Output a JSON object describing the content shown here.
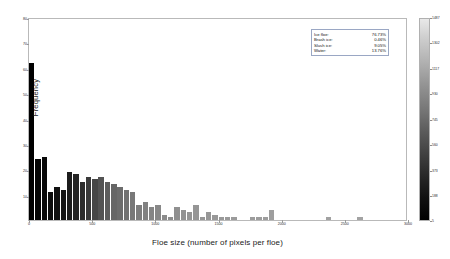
{
  "chart_data": {
    "type": "bar",
    "title": "",
    "xlabel": "Floe size (number of pixels per floe)",
    "ylabel": "Frequency",
    "xlim": [
      0,
      3000
    ],
    "ylim": [
      0,
      80
    ],
    "grid": false,
    "xticks": [
      0,
      500,
      1000,
      1500,
      2000,
      2500,
      3000
    ],
    "xticklabels": [
      "0",
      "500",
      "1000",
      "1500",
      "2000",
      "2500",
      "3000"
    ],
    "yticks": [
      10,
      20,
      30,
      40,
      50,
      60,
      70,
      80
    ],
    "yticklabels": [
      "10",
      "20",
      "30",
      "40",
      "50",
      "60",
      "70",
      "80"
    ],
    "bin_width": 50,
    "bin_centers": [
      25,
      75,
      125,
      175,
      225,
      275,
      325,
      375,
      425,
      475,
      525,
      575,
      625,
      675,
      725,
      775,
      825,
      875,
      925,
      975,
      1025,
      1075,
      1125,
      1175,
      1225,
      1275,
      1325,
      1375,
      1425,
      1475,
      1525,
      1575,
      1625,
      1675,
      1725,
      1775,
      1825,
      1875,
      1925,
      1975,
      2025,
      2075,
      2125,
      2175,
      2225,
      2275,
      2325,
      2375,
      2425,
      2475,
      2525,
      2575,
      2625,
      2675,
      2725,
      2775,
      2825,
      2875,
      2925,
      2975
    ],
    "values": [
      62,
      24,
      25,
      11,
      13,
      12,
      19,
      18,
      15,
      17,
      16,
      17,
      15,
      14,
      13,
      12,
      11,
      6,
      7,
      5,
      6,
      2,
      1,
      5,
      4,
      3,
      6,
      1,
      3,
      2,
      1,
      1,
      1,
      0,
      0,
      1,
      1,
      1,
      4,
      0,
      0,
      0,
      0,
      0,
      0,
      0,
      0,
      1,
      0,
      0,
      0,
      0,
      1,
      0,
      0,
      0,
      0,
      0,
      0,
      0
    ],
    "bar_colors": [
      "#000000",
      "#050505",
      "#090909",
      "#0d0d0d",
      "#111111",
      "#151515",
      "#1d1d1d",
      "#252525",
      "#2d2d2d",
      "#3a3a3a",
      "#474747",
      "#535353",
      "#5d5d5d",
      "#666666",
      "#6c6c6c",
      "#727272",
      "#787878",
      "#7d7d7d",
      "#818181",
      "#858585",
      "#888888",
      "#8b8b8b",
      "#8e8e8e",
      "#909090",
      "#929292",
      "#949494",
      "#959595",
      "#969696",
      "#979797",
      "#989898",
      "#999999",
      "#9a9a9a",
      "#9b9b9b",
      "#9b9b9b",
      "#9c9c9c",
      "#9c9c9c",
      "#9d9d9d",
      "#9d9d9d",
      "#9e9e9e",
      "#9e9e9e",
      "#9f9f9f",
      "#9f9f9f",
      "#9f9f9f",
      "#a0a0a0",
      "#a0a0a0",
      "#a0a0a0",
      "#a1a1a1",
      "#a1a1a1",
      "#a1a1a1",
      "#a2a2a2",
      "#a2a2a2",
      "#a2a2a2",
      "#a3a3a3",
      "#a3a3a3",
      "#a3a3a3",
      "#a3a3a3",
      "#a4a4a4",
      "#a4a4a4",
      "#a4a4a4",
      "#a4a4a4"
    ],
    "legend_position": "upper right",
    "annotations": [
      {
        "key": "Ice floe:",
        "value": "76.73%"
      },
      {
        "key": "Brash ice:",
        "value": "0.46%"
      },
      {
        "key": "Slush ice:",
        "value": "9.05%"
      },
      {
        "key": "Water:",
        "value": "13.76%"
      }
    ],
    "colorbar": {
      "orientation": "vertical",
      "colormap": "gray_reversed",
      "ticks": [
        1487,
        1302,
        1117,
        930,
        745,
        560,
        373,
        188,
        5
      ],
      "ticklabels": [
        "1487",
        "1302",
        "1117",
        "930",
        "745",
        "560",
        "373",
        "188",
        "5"
      ],
      "vmin": 5,
      "vmax": 1487
    }
  }
}
